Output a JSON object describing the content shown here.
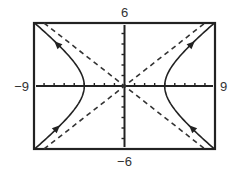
{
  "chart_data": {
    "type": "line",
    "title": "",
    "xlabel": "",
    "ylabel": "",
    "xlim": [
      -9,
      9
    ],
    "ylim": [
      -6,
      6
    ],
    "xscale_ticks": 1,
    "yscale_ticks": 1,
    "grid": false,
    "window_labels": {
      "xmin": "−9",
      "xmax": "9",
      "ymin": "−6",
      "ymax": "6"
    },
    "series": [
      {
        "name": "hyperbola",
        "equation": "x^2/16 - y^2/9 = 1",
        "a": 4,
        "b": 3,
        "style": "solid",
        "vertices": [
          [
            -4,
            0
          ],
          [
            4,
            0
          ]
        ]
      },
      {
        "name": "asymptote-positive",
        "equation": "y = 3x/4",
        "slope": 0.75,
        "style": "dashed"
      },
      {
        "name": "asymptote-negative",
        "equation": "y = -3x/4",
        "slope": -0.75,
        "style": "dashed"
      }
    ],
    "arrows": [
      {
        "x": -6.7,
        "y": 4.0,
        "direction": "outward"
      },
      {
        "x": -6.7,
        "y": -4.0,
        "direction": "inward"
      },
      {
        "x": 6.7,
        "y": 4.0,
        "direction": "outward"
      },
      {
        "x": 6.7,
        "y": -4.0,
        "direction": "inward"
      }
    ]
  }
}
